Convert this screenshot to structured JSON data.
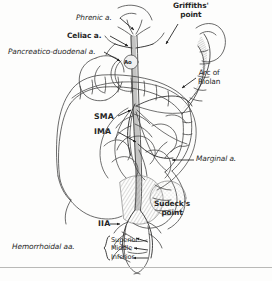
{
  "figure": {
    "background_color": "#fdfdfc",
    "ink_color": "#2b2b2b",
    "width": 272,
    "height": 281
  },
  "labels": {
    "phrenic": "Phrenic a.",
    "celiac": "Celiac a.",
    "pancreatico_duodenal": "Pancreatico-duodenal a.",
    "griffiths_point": "Griffiths'\npoint",
    "arc_of_riolan": "Arc of\nRiolan",
    "aorta": "Ao",
    "sma": "SMA",
    "ima": "IMA",
    "marginal": "Marginal a.",
    "sudecks_point": "Sudeck's\npoint",
    "iia": "IIA",
    "hemorrhoidal": "Hemorrhoidal aa.",
    "hemorrhoidal_branches": "Superior\nMiddle\nInferior"
  },
  "footer": {
    "rule_color": "#b9b9b7",
    "caption": ""
  }
}
